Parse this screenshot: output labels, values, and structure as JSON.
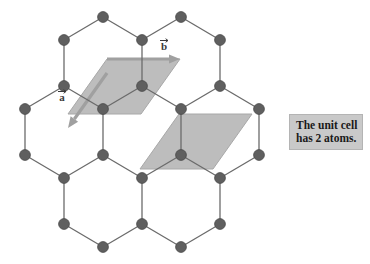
{
  "figure": {
    "type": "lattice-diagram",
    "background_color": "#ffffff",
    "atom_color": "#5f5f5f",
    "atom_stroke_color": "#4a4a4a",
    "bond_color": "#6b6b6b",
    "cell_fill_color": "#bdbdbd",
    "cell_stroke_color": "#a8a8a8",
    "vector_color": "#a0a0a0",
    "label_color": "#3a3a3a"
  },
  "vectors": [
    {
      "name": "lattice-vector-a",
      "label": "a",
      "has_overbar": true,
      "label_x": 62,
      "label_y": 101,
      "start_x": 107,
      "start_y": 73,
      "end_x": 68,
      "end_y": 128
    },
    {
      "name": "lattice-vector-b",
      "label": "b",
      "has_overbar": true,
      "label_x": 164,
      "label_y": 50,
      "start_x": 107,
      "start_y": 59,
      "end_x": 180,
      "end_y": 59
    }
  ],
  "unit_cells": [
    {
      "name": "unit-cell-left",
      "points": "107,59 180,59 141,114 68,114"
    },
    {
      "name": "unit-cell-right",
      "points": "179,114 252,114 213,169 140,169"
    }
  ],
  "atoms": [
    {
      "id": "a1",
      "x": 103,
      "y": 17
    },
    {
      "id": "a2",
      "x": 181,
      "y": 17
    },
    {
      "id": "a3",
      "x": 64,
      "y": 40
    },
    {
      "id": "a4",
      "x": 142,
      "y": 40
    },
    {
      "id": "a5",
      "x": 220,
      "y": 40
    },
    {
      "id": "a6",
      "x": 64,
      "y": 86
    },
    {
      "id": "a7",
      "x": 142,
      "y": 86
    },
    {
      "id": "a8",
      "x": 220,
      "y": 86
    },
    {
      "id": "a9",
      "x": 25,
      "y": 109
    },
    {
      "id": "a10",
      "x": 103,
      "y": 109
    },
    {
      "id": "a11",
      "x": 181,
      "y": 109
    },
    {
      "id": "a12",
      "x": 259,
      "y": 109
    },
    {
      "id": "a13",
      "x": 25,
      "y": 155
    },
    {
      "id": "a14",
      "x": 103,
      "y": 155
    },
    {
      "id": "a15",
      "x": 181,
      "y": 155
    },
    {
      "id": "a16",
      "x": 259,
      "y": 155
    },
    {
      "id": "a17",
      "x": 64,
      "y": 178
    },
    {
      "id": "a18",
      "x": 142,
      "y": 178
    },
    {
      "id": "a19",
      "x": 220,
      "y": 178
    },
    {
      "id": "a20",
      "x": 64,
      "y": 224
    },
    {
      "id": "a21",
      "x": 142,
      "y": 224
    },
    {
      "id": "a22",
      "x": 220,
      "y": 224
    },
    {
      "id": "a23",
      "x": 103,
      "y": 247
    },
    {
      "id": "a24",
      "x": 181,
      "y": 247
    }
  ],
  "bonds": [
    {
      "from": "a1",
      "to": "a3"
    },
    {
      "from": "a1",
      "to": "a4"
    },
    {
      "from": "a2",
      "to": "a4"
    },
    {
      "from": "a2",
      "to": "a5"
    },
    {
      "from": "a3",
      "to": "a6"
    },
    {
      "from": "a4",
      "to": "a7"
    },
    {
      "from": "a5",
      "to": "a8"
    },
    {
      "from": "a6",
      "to": "a9"
    },
    {
      "from": "a6",
      "to": "a10"
    },
    {
      "from": "a7",
      "to": "a10"
    },
    {
      "from": "a7",
      "to": "a11"
    },
    {
      "from": "a8",
      "to": "a11"
    },
    {
      "from": "a8",
      "to": "a12"
    },
    {
      "from": "a9",
      "to": "a13"
    },
    {
      "from": "a10",
      "to": "a14"
    },
    {
      "from": "a11",
      "to": "a15"
    },
    {
      "from": "a12",
      "to": "a16"
    },
    {
      "from": "a13",
      "to": "a17"
    },
    {
      "from": "a14",
      "to": "a17"
    },
    {
      "from": "a14",
      "to": "a18"
    },
    {
      "from": "a15",
      "to": "a18"
    },
    {
      "from": "a15",
      "to": "a19"
    },
    {
      "from": "a16",
      "to": "a19"
    },
    {
      "from": "a17",
      "to": "a20"
    },
    {
      "from": "a18",
      "to": "a21"
    },
    {
      "from": "a19",
      "to": "a22"
    },
    {
      "from": "a20",
      "to": "a23"
    },
    {
      "from": "a21",
      "to": "a23"
    },
    {
      "from": "a21",
      "to": "a24"
    },
    {
      "from": "a22",
      "to": "a24"
    }
  ],
  "caption": {
    "line1": "The unit cell",
    "line2": "has 2 atoms.",
    "background_color": "#c9c9c9",
    "text_color": "#1a1a1a"
  }
}
